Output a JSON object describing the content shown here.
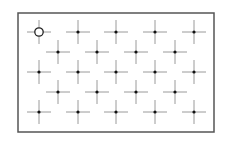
{
  "diagram": {
    "frame": {
      "x": 18,
      "y": 13,
      "width": 196,
      "height": 119,
      "stroke": "#555555"
    },
    "crosshair": {
      "arm": 12,
      "line_color": "#9a9a9a",
      "dot_color": "#111111",
      "dot_radius": 1.6
    },
    "marker": {
      "type": "circle",
      "radius": 4.2,
      "stroke": "#222222"
    },
    "rows": [
      {
        "y": 32,
        "xs": [
          39,
          78,
          116,
          155,
          194
        ]
      },
      {
        "y": 52,
        "xs": [
          58,
          97,
          136,
          175
        ]
      },
      {
        "y": 72,
        "xs": [
          39,
          78,
          116,
          155,
          194
        ]
      },
      {
        "y": 92,
        "xs": [
          58,
          97,
          136,
          175
        ]
      },
      {
        "y": 112,
        "xs": [
          39,
          78,
          116,
          155,
          194
        ]
      }
    ],
    "highlighted": {
      "row": 0,
      "col": 0
    }
  }
}
